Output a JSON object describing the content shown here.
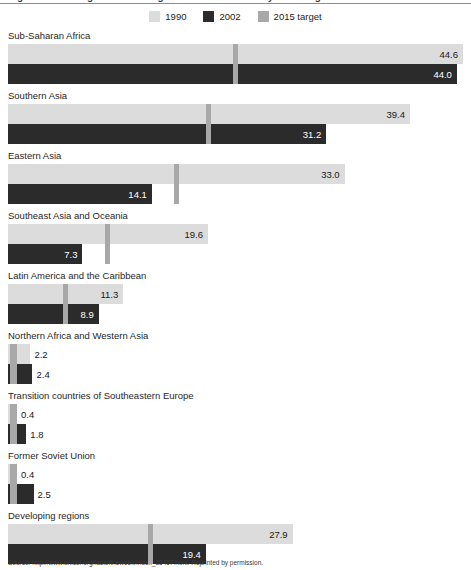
{
  "clipped_title": "Figure: Percentage of underweight children under five years of age",
  "legend": {
    "items": [
      {
        "label": "1990",
        "color": "#dcdcdc",
        "icon": "legend-swatch-1990"
      },
      {
        "label": "2002",
        "color": "#2b2b2b",
        "icon": "legend-swatch-2002"
      },
      {
        "label": "2015 target",
        "color": "#a8a8a8",
        "icon": "legend-swatch-2015-target"
      }
    ]
  },
  "source": "Source: http://www.unicef.org/factoftheweek/index_35457.html. Reprinted by permission.",
  "chart_data": {
    "type": "bar",
    "orientation": "horizontal",
    "title": "Figure: Percentage of underweight children under five years of age",
    "xlabel": "",
    "ylabel": "",
    "xlim": [
      0,
      44.6
    ],
    "grid": false,
    "legend_position": "top-center",
    "categories": [
      "Sub-Saharan Africa",
      "Southern Asia",
      "Eastern Asia",
      "Southeast Asia and Oceania",
      "Latin America and the Caribbean",
      "Northern Africa and Western Asia",
      "Transition countries of Southeastern Europe",
      "Former Soviet Union",
      "Developing regions"
    ],
    "series": [
      {
        "name": "1990",
        "color": "#dcdcdc",
        "values": [
          44.6,
          39.4,
          33.0,
          19.6,
          11.3,
          2.2,
          0.4,
          0.4,
          27.9
        ]
      },
      {
        "name": "2002",
        "color": "#2b2b2b",
        "values": [
          44.0,
          31.2,
          14.1,
          7.3,
          8.9,
          2.4,
          1.8,
          2.5,
          19.4
        ]
      },
      {
        "name": "2015 target",
        "color": "#a8a8a8",
        "values": [
          22.3,
          19.7,
          16.5,
          9.8,
          5.65,
          1.1,
          0.2,
          0.2,
          13.95
        ]
      }
    ],
    "labels": {
      "1990": [
        "44.6",
        "39.4",
        "33.0",
        "19.6",
        "11.3",
        "2.2",
        "0.4",
        "0.4",
        "27.9"
      ],
      "2002": [
        "44.0",
        "31.2",
        "14.1",
        "7.3",
        "8.9",
        "2.4",
        "1.8",
        "2.5",
        "19.4"
      ]
    }
  }
}
